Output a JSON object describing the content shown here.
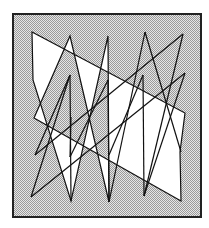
{
  "figure": {
    "frame": {
      "x": 13,
      "y": 14,
      "width": 188,
      "height": 203
    },
    "background_color": "#ffffff",
    "frame_fill_color": "#c8c8c8",
    "frame_stroke_color": "#222222",
    "polygon_fill_color": "#ffffff",
    "polygon_stroke_color": "#111111",
    "fill_rule": "evenodd",
    "polygon_points": [
      [
        32,
        32
      ],
      [
        185,
        113
      ],
      [
        180,
        152
      ],
      [
        181,
        201
      ],
      [
        34,
        118
      ],
      [
        70,
        36
      ],
      [
        109,
        202
      ],
      [
        108,
        36
      ],
      [
        71,
        201
      ],
      [
        33,
        80
      ],
      [
        32,
        32
      ]
    ],
    "extra_segments": [
      [
        [
          31,
          197
        ],
        [
          185,
          73
        ]
      ],
      [
        [
          183,
          34
        ],
        [
          35,
          155
        ]
      ],
      [
        [
          35,
          155
        ],
        [
          70,
          75
        ]
      ],
      [
        [
          70,
          75
        ],
        [
          71,
          201
        ]
      ],
      [
        [
          31,
          197
        ],
        [
          70,
          75
        ]
      ],
      [
        [
          145,
          32
        ],
        [
          181,
          152
        ]
      ],
      [
        [
          145,
          32
        ],
        [
          109,
          202
        ]
      ],
      [
        [
          144,
          196
        ],
        [
          185,
          73
        ]
      ],
      [
        [
          144,
          196
        ],
        [
          143,
          75
        ]
      ],
      [
        [
          143,
          75
        ],
        [
          109,
          155
        ]
      ],
      [
        [
          71,
          117
        ],
        [
          70,
          157
        ]
      ],
      [
        [
          70,
          157
        ],
        [
          108,
          80
        ]
      ],
      [
        [
          108,
          80
        ],
        [
          109,
          202
        ]
      ],
      [
        [
          183,
          34
        ],
        [
          144,
          196
        ]
      ]
    ]
  }
}
